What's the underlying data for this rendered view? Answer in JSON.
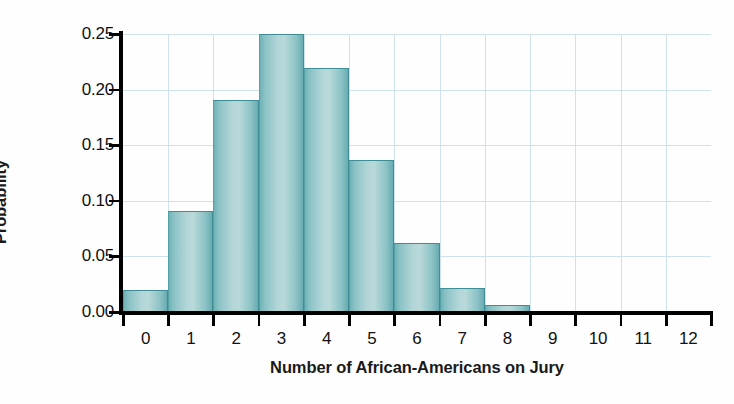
{
  "chart_data": {
    "type": "bar",
    "title": "",
    "subtitle": "",
    "xlabel": "Number of African-Americans on Jury",
    "ylabel": "Probability",
    "categories": [
      "0",
      "1",
      "2",
      "3",
      "4",
      "5",
      "6",
      "7",
      "8",
      "9",
      "10",
      "11",
      "12"
    ],
    "values": [
      0.02,
      0.091,
      0.191,
      0.25,
      0.219,
      0.137,
      0.062,
      0.022,
      0.006,
      0.0,
      0.0,
      0.0,
      0.0
    ],
    "xlim": [
      -0.5,
      12.5
    ],
    "ylim": [
      0.0,
      0.25
    ],
    "y_ticks": [
      "0.00",
      "0.05",
      "0.10",
      "0.15",
      "0.20",
      "0.25"
    ],
    "y_tick_values": [
      0.0,
      0.05,
      0.1,
      0.15,
      0.2,
      0.25
    ],
    "x_ticks": [
      "0",
      "1",
      "2",
      "3",
      "4",
      "5",
      "6",
      "7",
      "8",
      "9",
      "10",
      "11",
      "12"
    ],
    "grid": true,
    "grid_color": "#cfe2ec",
    "legend": null,
    "legend_position": "none",
    "bar_fill_color": "#a8cfd2",
    "bar_edge_color": "#3f8e96",
    "axis_color": "#000000",
    "text_color": "#111111"
  },
  "axes": {
    "y_title": "Probability",
    "x_title": "Number of African-Americans on Jury"
  }
}
